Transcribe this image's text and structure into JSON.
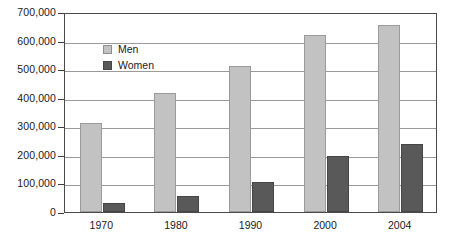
{
  "chart_data": {
    "type": "bar",
    "title": "",
    "subtitle": "",
    "xlabel": "",
    "ylabel": "",
    "categories": [
      "1970",
      "1980",
      "1990",
      "2000",
      "2004"
    ],
    "series": [
      {
        "name": "Men",
        "color": "#c2c2c2",
        "values": [
          310000,
          415000,
          510000,
          620000,
          655000
        ]
      },
      {
        "name": "Women",
        "color": "#595959",
        "values": [
          30000,
          55000,
          105000,
          195000,
          237000
        ]
      }
    ],
    "ylim": [
      0,
      700000
    ],
    "ytick_step": 100000,
    "ytick_labels": [
      "0",
      "100,000",
      "200,000",
      "300,000",
      "400,000",
      "500,000",
      "600,000",
      "700,000"
    ],
    "ytick_values": [
      0,
      100000,
      200000,
      300000,
      400000,
      500000,
      600000,
      700000
    ],
    "grid": true,
    "legend_position": "inside-top-left",
    "legend_entries": [
      "Men",
      "Women"
    ]
  }
}
